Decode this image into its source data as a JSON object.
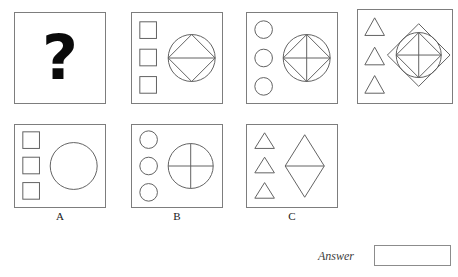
{
  "puzzle": {
    "kind": "visual-analogy-matrix",
    "stroke_color": "#5f5f5f",
    "panel_border_color": "#7d7d7d",
    "question_glyph": "?",
    "top_row": [
      {
        "id": "cell-question",
        "name": "question-cell",
        "x": 14,
        "y": 12,
        "w": 92,
        "h": 92,
        "type": "question",
        "left_column": [],
        "main": []
      },
      {
        "id": "cell-2",
        "name": "matrix-cell-2",
        "x": 131,
        "y": 12,
        "w": 92,
        "h": 92,
        "type": "shapes",
        "left_column": [
          "square",
          "square",
          "square"
        ],
        "main": [
          "circle",
          "diamond",
          "horizontal-line"
        ]
      },
      {
        "id": "cell-3",
        "name": "matrix-cell-3",
        "x": 246,
        "y": 12,
        "w": 92,
        "h": 92,
        "type": "shapes",
        "left_column": [
          "circle",
          "circle",
          "circle"
        ],
        "main": [
          "circle",
          "diamond",
          "horizontal-line",
          "vertical-line"
        ]
      },
      {
        "id": "cell-4",
        "name": "matrix-cell-4",
        "x": 357,
        "y": 9,
        "w": 96,
        "h": 95,
        "type": "shapes",
        "left_column": [
          "triangle",
          "triangle",
          "triangle"
        ],
        "main": [
          "outer-diamond",
          "circle",
          "diamond",
          "horizontal-line",
          "vertical-line"
        ]
      }
    ],
    "options": [
      {
        "id": "option-a",
        "label": "A",
        "x": 14,
        "y": 124,
        "w": 92,
        "h": 84,
        "left_column": [
          "square",
          "square",
          "square"
        ],
        "main": [
          "circle"
        ]
      },
      {
        "id": "option-b",
        "label": "B",
        "x": 131,
        "y": 124,
        "w": 92,
        "h": 84,
        "left_column": [
          "circle",
          "circle",
          "circle"
        ],
        "main": [
          "circle",
          "horizontal-line",
          "vertical-line"
        ]
      },
      {
        "id": "option-c",
        "label": "C",
        "x": 246,
        "y": 124,
        "w": 92,
        "h": 84,
        "left_column": [
          "triangle",
          "triangle",
          "triangle"
        ],
        "main": [
          "tall-diamond",
          "horizontal-line"
        ]
      }
    ],
    "answer": {
      "label": "Answer",
      "value": "",
      "placeholder": ""
    }
  }
}
